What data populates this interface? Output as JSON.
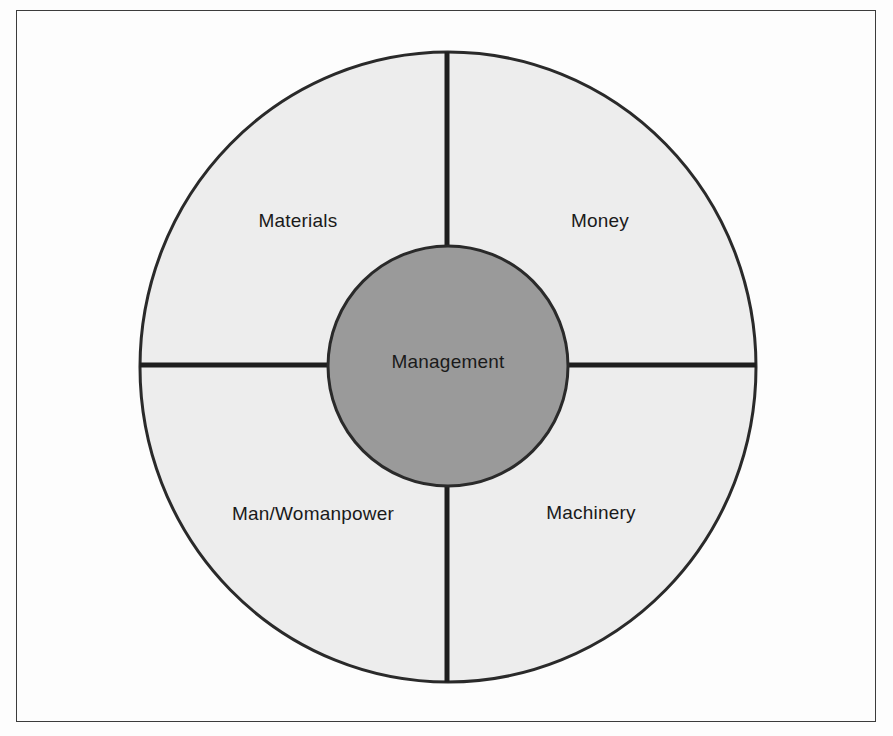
{
  "diagram": {
    "type": "concentric-circle-quadrant",
    "hub": {
      "label": "Management",
      "fill_color": "#9a9a9a",
      "stroke_color": "#2a2a2a",
      "center_x": 448,
      "center_y": 366,
      "radius": 120
    },
    "ring": {
      "fill_color": "#ededed",
      "stroke_color": "#2a2a2a",
      "center_x": 448,
      "center_y": 367,
      "radius_x": 308,
      "radius_y": 315
    },
    "frame": {
      "stroke_color": "#3c3c3c",
      "background_color": "#fdfdfd"
    },
    "divider": {
      "color": "#1e1e1e",
      "thickness": 5
    },
    "segments": [
      {
        "id": "materials",
        "label": "Materials",
        "quadrant": "top-left",
        "label_x": 298,
        "label_y": 222
      },
      {
        "id": "money",
        "label": "Money",
        "quadrant": "top-right",
        "label_x": 600,
        "label_y": 222
      },
      {
        "id": "man-womanpower",
        "label": "Man/Womanpower",
        "quadrant": "bottom-left",
        "label_x": 313,
        "label_y": 515
      },
      {
        "id": "machinery",
        "label": "Machinery",
        "quadrant": "bottom-right",
        "label_x": 591,
        "label_y": 514
      }
    ]
  }
}
